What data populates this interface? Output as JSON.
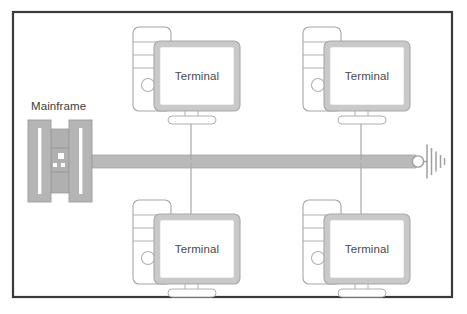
{
  "diagram": {
    "type": "network-topology-bus",
    "title_visible": false,
    "canvas": {
      "width": 467,
      "height": 314,
      "background": "#ffffff"
    },
    "border": {
      "color": "#3a3a3a",
      "x": 13,
      "y": 12,
      "width": 439,
      "height": 285,
      "stroke_width": 2.2
    },
    "palette": {
      "outline": "#9a9a9a",
      "bus_fill": "#b9b9b9",
      "bus_stroke": "#a6a6a6",
      "cabinet_fill": "#b5b5b5",
      "cabinet_stroke": "#9c9c9c",
      "slot_fill": "#fdfdfd",
      "bezel_fill": "#c9c9c9",
      "bezel_stroke": "#a8a8a8",
      "screen_fill": "#ffffff",
      "text": "#4a4a4a",
      "connector": "#a8a8a8"
    },
    "mainframe": {
      "label": "Mainframe",
      "label_x": 31,
      "label_y": 110,
      "x": 28,
      "y": 120,
      "width": 72,
      "height": 82,
      "left_cabinet": {
        "x": 28,
        "y": 120,
        "width": 23,
        "height": 82
      },
      "right_cabinet": {
        "x": 69,
        "y": 120,
        "width": 23,
        "height": 82
      },
      "mid_section": {
        "x": 51,
        "y": 129,
        "width": 18,
        "height": 64
      },
      "slots": 2,
      "mid_indicators": 3
    },
    "bus": {
      "x": 92,
      "y": 155,
      "width": 324,
      "height": 13,
      "label": "bus-backbone"
    },
    "terminator": {
      "label": "bus-terminator",
      "circle_cx": 420,
      "circle_cy": 161.5,
      "circle_r": 5.5,
      "ground_x": 427,
      "ground_lines": [
        {
          "dx": 0,
          "half": 17
        },
        {
          "dx": 4,
          "half": 13.5
        },
        {
          "dx": 8,
          "half": 10
        },
        {
          "dx": 12,
          "half": 6.5
        },
        {
          "dx": 15.5,
          "half": 3.5
        }
      ]
    },
    "terminals": [
      {
        "id": "terminal-top-left",
        "label": "Terminal",
        "position": "top-left",
        "tower": {
          "x": 133,
          "y": 27,
          "width": 38,
          "height": 84
        },
        "monitor": {
          "x": 154,
          "y": 41,
          "width": 86,
          "height": 70
        },
        "stand_base_y": 116,
        "drop_line": {
          "x": 191,
          "y1": 121,
          "y2": 160
        }
      },
      {
        "id": "terminal-top-right",
        "label": "Terminal",
        "position": "top-right",
        "tower": {
          "x": 303,
          "y": 27,
          "width": 38,
          "height": 84
        },
        "monitor": {
          "x": 324,
          "y": 41,
          "width": 86,
          "height": 70
        },
        "stand_base_y": 116,
        "drop_line": {
          "x": 361,
          "y1": 121,
          "y2": 160
        }
      },
      {
        "id": "terminal-bottom-left",
        "label": "Terminal",
        "position": "bottom-left",
        "tower": {
          "x": 133,
          "y": 200,
          "width": 38,
          "height": 84
        },
        "monitor": {
          "x": 154,
          "y": 214,
          "width": 86,
          "height": 70
        },
        "stand_base_y": 289,
        "drop_line": {
          "x": 191,
          "y1": 163,
          "y2": 214
        }
      },
      {
        "id": "terminal-bottom-right",
        "label": "Terminal",
        "position": "bottom-right",
        "tower": {
          "x": 303,
          "y": 200,
          "width": 38,
          "height": 84
        },
        "monitor": {
          "x": 324,
          "y": 214,
          "width": 86,
          "height": 70
        },
        "stand_base_y": 289,
        "drop_line": {
          "x": 361,
          "y1": 163,
          "y2": 214
        }
      }
    ]
  }
}
